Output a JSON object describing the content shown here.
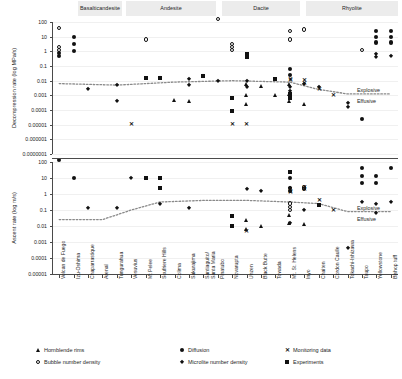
{
  "chart_data": {
    "type": "scatter",
    "title": "",
    "composition_bands": [
      {
        "label": "Basaltic\nandesite",
        "x": 78,
        "w": 44
      },
      {
        "label": "Andesite",
        "x": 126,
        "w": 90
      },
      {
        "label": "Dacite",
        "x": 222,
        "w": 78
      },
      {
        "label": "Rhyolite",
        "x": 306,
        "w": 92
      }
    ],
    "categories": [
      "Volcan de Fuego",
      "Izu-Oshima",
      "Chaparrastique",
      "Arenal",
      "Tungurahua",
      "Vesuvius",
      "Mt Pelee",
      "Soufriere Hills",
      "Colima",
      "Sakurajima",
      "Santiaguito/\nSanta Maria",
      "Pinatubo",
      "Novarupta",
      "Unzen",
      "Black Butte",
      "Towada",
      "Mt. St. Helens",
      "Inyo",
      "Chaiten",
      "Cordon Caulle",
      "Tokachi-Ishizawa",
      "Taupo",
      "Yellowstone",
      "Bishop tuff"
    ],
    "panels": [
      {
        "id": "decompression",
        "ylabel": "Decompression rate (log MPa/s)",
        "yticks": [
          "100",
          "10",
          "1",
          "0.1",
          "0.01",
          "0.001",
          "0.0001",
          "0.00001",
          "0.000001",
          "0.0000001"
        ],
        "ytick_values": [
          2,
          1,
          0,
          -1,
          -2,
          -3,
          -4,
          -5,
          -6,
          -7
        ],
        "region_labels": {
          "upper": "Explosive",
          "lower": "Effusive"
        },
        "series": [
          {
            "name": "Hornblende rims",
            "marker": "tri",
            "points": [
              [
                8,
                -3.3
              ],
              [
                9,
                -3.4
              ],
              [
                13,
                -2.2
              ],
              [
                13,
                -3.0
              ],
              [
                13,
                -3.6
              ],
              [
                14,
                -2.4
              ],
              [
                15,
                -3.0
              ],
              [
                16,
                -2.2
              ],
              [
                16,
                -2.9
              ],
              [
                16,
                -3.4
              ],
              [
                17,
                -3.6
              ]
            ]
          },
          {
            "name": "Diffusion",
            "marker": "circle",
            "points": [
              [
                0,
                -0.3
              ],
              [
                0,
                -0.1
              ],
              [
                1,
                0.0
              ],
              [
                1,
                0.5
              ],
              [
                1,
                1.0
              ],
              [
                16,
                -1.6
              ],
              [
                16,
                -1.2
              ],
              [
                22,
                0.6
              ],
              [
                22,
                1.0
              ],
              [
                22,
                1.4
              ],
              [
                23,
                0.6
              ],
              [
                23,
                1.0
              ],
              [
                23,
                1.4
              ],
              [
                21,
                -4.6
              ]
            ]
          },
          {
            "name": "Monitoring data",
            "marker": "ex",
            "points": [
              [
                5,
                -5.0
              ],
              [
                12,
                -5.0
              ],
              [
                16,
                -2.0
              ],
              [
                16,
                -1.9
              ],
              [
                17,
                -2.0
              ],
              [
                17,
                -2.2
              ],
              [
                18,
                -2.6
              ],
              [
                19,
                -3.0
              ],
              [
                13,
                -5.0
              ]
            ]
          },
          {
            "name": "Bubble number density",
            "marker": "ocircle",
            "points": [
              [
                0,
                1.6
              ],
              [
                0,
                0.3
              ],
              [
                0,
                0.1
              ],
              [
                6,
                0.8
              ],
              [
                11,
                2.2
              ],
              [
                12,
                0.3
              ],
              [
                12,
                0.1
              ],
              [
                16,
                1.4
              ],
              [
                16,
                0.8
              ],
              [
                17,
                1.5
              ],
              [
                21,
                0.1
              ],
              [
                12,
                0.5
              ]
            ]
          },
          {
            "name": "Microlite number density",
            "marker": "diamond",
            "points": [
              [
                2,
                -2.6
              ],
              [
                4,
                -2.3
              ],
              [
                4,
                -3.4
              ],
              [
                7,
                -1.8
              ],
              [
                9,
                -1.9
              ],
              [
                9,
                -2.3
              ],
              [
                10,
                -1.7
              ],
              [
                11,
                -2.0
              ],
              [
                13,
                -2.0
              ],
              [
                13,
                -2.4
              ],
              [
                16,
                -2.4
              ],
              [
                16,
                -2.7
              ],
              [
                17,
                -2.2
              ],
              [
                18,
                -2.4
              ],
              [
                20,
                -3.5
              ],
              [
                20,
                -3.8
              ],
              [
                22,
                -0.2
              ],
              [
                22,
                -0.4
              ],
              [
                23,
                -0.3
              ]
            ]
          },
          {
            "name": "Experiments",
            "marker": "square",
            "points": [
              [
                6,
                -1.8
              ],
              [
                7,
                -1.8
              ],
              [
                10,
                -1.7
              ],
              [
                12,
                -3.2
              ],
              [
                12,
                -4.1
              ],
              [
                13,
                -0.2
              ],
              [
                13,
                -0.4
              ],
              [
                16,
                -2.9
              ],
              [
                16,
                -3.2
              ],
              [
                15,
                -1.9
              ]
            ]
          }
        ],
        "trend": [
          [
            0,
            -2.2
          ],
          [
            4,
            -2.3
          ],
          [
            8,
            -2.1
          ],
          [
            12,
            -2.0
          ],
          [
            16,
            -2.1
          ],
          [
            18,
            -2.6
          ],
          [
            20,
            -2.9
          ],
          [
            21,
            -2.9
          ],
          [
            23,
            -2.9
          ]
        ]
      },
      {
        "id": "ascent",
        "ylabel": "Ascent rate (log m/s)",
        "yticks": [
          "100",
          "10",
          "1",
          "0.1",
          "0.01",
          "0.001",
          "0.0001",
          "0.00001"
        ],
        "ytick_values": [
          2,
          1,
          0,
          -1,
          -2,
          -3,
          -4,
          -5
        ],
        "region_labels": {
          "upper": "Explosive",
          "lower": "Effusive"
        },
        "series": [
          {
            "name": "Hornblende rims",
            "marker": "tri",
            "points": [
              [
                13,
                -1.6
              ],
              [
                13,
                -2.2
              ],
              [
                14,
                -2.0
              ],
              [
                16,
                -1.3
              ],
              [
                16,
                -1.8
              ],
              [
                17,
                -1.9
              ]
            ]
          },
          {
            "name": "Diffusion",
            "marker": "circle",
            "points": [
              [
                0,
                2.1
              ],
              [
                1,
                1.0
              ],
              [
                16,
                1.0
              ],
              [
                16,
                0.4
              ],
              [
                16,
                0.2
              ],
              [
                21,
                0.7
              ],
              [
                21,
                1.1
              ],
              [
                21,
                1.6
              ],
              [
                22,
                0.7
              ],
              [
                22,
                1.1
              ],
              [
                23,
                1.6
              ]
            ]
          },
          {
            "name": "Monitoring data",
            "marker": "ex",
            "points": [
              [
                16,
                0.2
              ],
              [
                16,
                0.1
              ],
              [
                17,
                0.4
              ],
              [
                17,
                0.3
              ],
              [
                18,
                -0.4
              ],
              [
                19,
                -1.0
              ],
              [
                13,
                -2.3
              ]
            ]
          },
          {
            "name": "Bubble number density",
            "marker": "ocircle",
            "points": [
              [
                16,
                -0.6
              ],
              [
                16,
                -0.8
              ],
              [
                16,
                -1.0
              ],
              [
                17,
                0.4
              ],
              [
                17,
                0.3
              ]
            ]
          },
          {
            "name": "Microlite number density",
            "marker": "diamond",
            "points": [
              [
                2,
                -0.9
              ],
              [
                4,
                -0.9
              ],
              [
                5,
                1.0
              ],
              [
                7,
                -0.6
              ],
              [
                9,
                -0.9
              ],
              [
                13,
                0.3
              ],
              [
                14,
                0.2
              ],
              [
                16,
                0.4
              ],
              [
                16,
                -1.8
              ],
              [
                17,
                -1.0
              ],
              [
                20,
                -3.4
              ],
              [
                21,
                -0.5
              ],
              [
                22,
                -0.6
              ],
              [
                22,
                -1.2
              ],
              [
                23,
                -0.5
              ]
            ]
          },
          {
            "name": "Experiments",
            "marker": "square",
            "points": [
              [
                6,
                1.0
              ],
              [
                7,
                1.0
              ],
              [
                7,
                0.4
              ],
              [
                12,
                -1.4
              ],
              [
                12,
                -2.0
              ],
              [
                18,
                -0.7
              ],
              [
                16,
                1.4
              ]
            ]
          }
        ],
        "trend": [
          [
            0,
            -1.6
          ],
          [
            3,
            -1.6
          ],
          [
            5,
            -1.0
          ],
          [
            7,
            -0.5
          ],
          [
            10,
            -0.4
          ],
          [
            13,
            -0.4
          ],
          [
            16,
            -0.5
          ],
          [
            18,
            -0.6
          ],
          [
            20,
            -1.1
          ],
          [
            23,
            -1.1
          ]
        ]
      }
    ],
    "legend": [
      {
        "label": "Hornblende rims",
        "marker": "tri"
      },
      {
        "label": "Diffusion",
        "marker": "circle"
      },
      {
        "label": "Monitoring data",
        "marker": "ex"
      },
      {
        "label": "Bubble number density",
        "marker": "ocircle"
      },
      {
        "label": "Microlite number density",
        "marker": "diamond"
      },
      {
        "label": "Experiments",
        "marker": "square"
      }
    ],
    "grid": true,
    "legend_position": "bottom"
  }
}
